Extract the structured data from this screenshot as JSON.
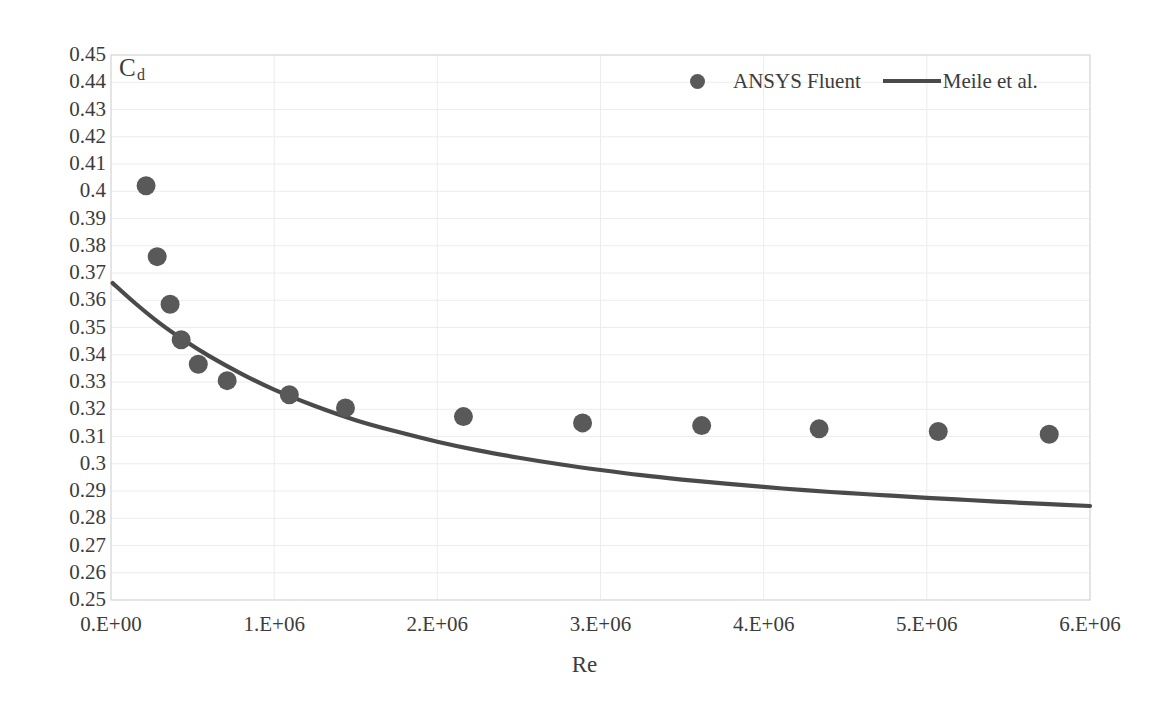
{
  "chart_data": {
    "type": "scatter",
    "title": "",
    "xlabel": "Re",
    "ylabel": "Cd",
    "ylabel_base": "C",
    "ylabel_sub": "d",
    "xlim": [
      0,
      6000000
    ],
    "ylim": [
      0.25,
      0.45
    ],
    "grid": true,
    "legend_position": "top-right",
    "x_tick_labels": [
      "0.E+00",
      "1.E+06",
      "2.E+06",
      "3.E+06",
      "4.E+06",
      "5.E+06",
      "6.E+06"
    ],
    "x_tick_values": [
      0,
      1000000,
      2000000,
      3000000,
      4000000,
      5000000,
      6000000
    ],
    "y_tick_labels": [
      "0.45",
      "0.44",
      "0.43",
      "0.42",
      "0.41",
      "0.4",
      "0.39",
      "0.38",
      "0.37",
      "0.36",
      "0.35",
      "0.34",
      "0.33",
      "0.32",
      "0.31",
      "0.3",
      "0.29",
      "0.28",
      "0.27",
      "0.26",
      "0.25"
    ],
    "y_tick_values": [
      0.45,
      0.44,
      0.43,
      0.42,
      0.41,
      0.4,
      0.39,
      0.38,
      0.37,
      0.36,
      0.35,
      0.34,
      0.33,
      0.32,
      0.31,
      0.3,
      0.29,
      0.28,
      0.27,
      0.26,
      0.25
    ],
    "series": [
      {
        "name": "ANSYS Fluent",
        "type": "scatter",
        "marker": "circle",
        "color": "#595959",
        "points": [
          {
            "x": 215000,
            "y": 0.402
          },
          {
            "x": 283000,
            "y": 0.376
          },
          {
            "x": 362000,
            "y": 0.3585
          },
          {
            "x": 430000,
            "y": 0.3455
          },
          {
            "x": 535000,
            "y": 0.3365
          },
          {
            "x": 712000,
            "y": 0.3305
          },
          {
            "x": 1093000,
            "y": 0.3253
          },
          {
            "x": 1437000,
            "y": 0.3205
          },
          {
            "x": 2160000,
            "y": 0.3173
          },
          {
            "x": 2890000,
            "y": 0.315
          },
          {
            "x": 3620000,
            "y": 0.314
          },
          {
            "x": 4340000,
            "y": 0.3128
          },
          {
            "x": 5070000,
            "y": 0.3118
          },
          {
            "x": 5750000,
            "y": 0.3108
          }
        ]
      },
      {
        "name": "Meile et al.",
        "type": "line",
        "color": "#4a4a4a",
        "points": [
          {
            "x": 10000,
            "y": 0.3663
          },
          {
            "x": 150000,
            "y": 0.3588
          },
          {
            "x": 300000,
            "y": 0.3515
          },
          {
            "x": 450000,
            "y": 0.3452
          },
          {
            "x": 600000,
            "y": 0.3396
          },
          {
            "x": 800000,
            "y": 0.333
          },
          {
            "x": 1000000,
            "y": 0.3272
          },
          {
            "x": 1250000,
            "y": 0.3212
          },
          {
            "x": 1500000,
            "y": 0.316
          },
          {
            "x": 1750000,
            "y": 0.3118
          },
          {
            "x": 2000000,
            "y": 0.3081
          },
          {
            "x": 2250000,
            "y": 0.3049
          },
          {
            "x": 2500000,
            "y": 0.3022
          },
          {
            "x": 2750000,
            "y": 0.2998
          },
          {
            "x": 3000000,
            "y": 0.2977
          },
          {
            "x": 3250000,
            "y": 0.2958
          },
          {
            "x": 3500000,
            "y": 0.2942
          },
          {
            "x": 3750000,
            "y": 0.2928
          },
          {
            "x": 4000000,
            "y": 0.2915
          },
          {
            "x": 4250000,
            "y": 0.2903
          },
          {
            "x": 4500000,
            "y": 0.2893
          },
          {
            "x": 4750000,
            "y": 0.2884
          },
          {
            "x": 5000000,
            "y": 0.2875
          },
          {
            "x": 5250000,
            "y": 0.2867
          },
          {
            "x": 5500000,
            "y": 0.2859
          },
          {
            "x": 5750000,
            "y": 0.2852
          },
          {
            "x": 6000000,
            "y": 0.2845
          }
        ]
      }
    ]
  },
  "legend": {
    "entry1_label": "ANSYS Fluent",
    "entry2_label": "Meile et al."
  },
  "axes": {
    "x_title": "Re",
    "y_title_base": "C",
    "y_title_sub": "d"
  }
}
